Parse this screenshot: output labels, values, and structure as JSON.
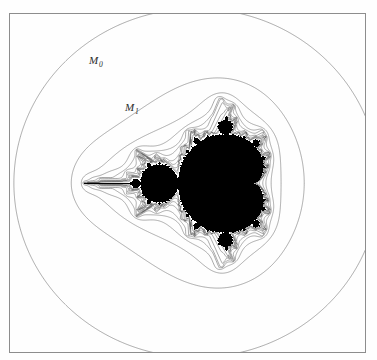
{
  "figure": {
    "kind": "mandelbrot-equipotential-diagram",
    "background_color": "#fefefe",
    "frame_color": "#8d8d8d",
    "set_color": "#000000",
    "contour_color": "#555555",
    "frame": {
      "x": 9,
      "y": 13,
      "width": 357,
      "height": 340
    }
  },
  "labels": [
    {
      "id": "M0",
      "base": "M",
      "subscript": "0",
      "x": 88,
      "y": 53
    },
    {
      "id": "M1",
      "base": "M",
      "subscript": "1",
      "x": 124,
      "y": 100
    }
  ],
  "chart_data": {
    "type": "contour",
    "title": "",
    "subtitle": "",
    "xlabel": "",
    "ylabel": "",
    "grid": false,
    "legend": "none",
    "annotations": [
      {
        "text": "M₀",
        "x": 88,
        "y": 53
      },
      {
        "text": "M₁",
        "x": 124,
        "y": 100
      }
    ],
    "series": [
      {
        "name": "M_0",
        "level": 0,
        "label": "M₀",
        "labeled": true
      },
      {
        "name": "M_1",
        "level": 1,
        "label": "M₁",
        "labeled": true
      },
      {
        "name": "M_2",
        "level": 2,
        "label": "",
        "labeled": false
      },
      {
        "name": "M_3",
        "level": 3,
        "label": "",
        "labeled": false
      },
      {
        "name": "M_4",
        "level": 4,
        "label": "",
        "labeled": false
      },
      {
        "name": "M_5",
        "level": 5,
        "label": "",
        "labeled": false
      },
      {
        "name": "M_6",
        "level": 6,
        "label": "",
        "labeled": false
      },
      {
        "name": "M_7",
        "level": 7,
        "label": "",
        "labeled": false
      },
      {
        "name": "M_8",
        "level": 8,
        "label": "",
        "labeled": false
      },
      {
        "name": "M_9",
        "level": 9,
        "label": "",
        "labeled": false
      },
      {
        "name": "M_10",
        "level": 10,
        "label": "",
        "labeled": false
      },
      {
        "name": "M_11",
        "level": 11,
        "label": "",
        "labeled": false
      },
      {
        "name": "M_12",
        "level": 12,
        "label": "",
        "labeled": false
      }
    ],
    "contour_count": 13,
    "plane": {
      "x_center": -0.62,
      "y_center": 0.0,
      "x_half_width": 2.35,
      "y_half_width": 2.24
    },
    "escape_radii": [
      17.5,
      9.4,
      5.6,
      4.1,
      3.25,
      2.78,
      2.48,
      2.3,
      2.18,
      2.105,
      2.06,
      2.035,
      2.018
    ]
  }
}
